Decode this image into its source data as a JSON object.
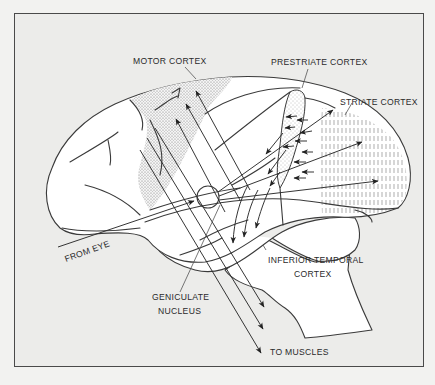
{
  "figure": {
    "type": "anatomical-diagram",
    "background_color": "#ececea",
    "line_color": "#3a3a3a",
    "labels": {
      "motor_cortex": "MOTOR CORTEX",
      "prestriate_cortex": "PRESTRIATE CORTEX",
      "striate_cortex": "STRIATE CORTEX",
      "from_eye": "FROM EYE",
      "geniculate_line1": "GENICULATE",
      "geniculate_line2": "NUCLEUS",
      "inferior_temporal_line1": "INFERIOR TEMPORAL",
      "inferior_temporal_line2": "CORTEX",
      "to_muscles": "TO MUSCLES"
    },
    "regions": [
      {
        "name": "motor-cortex",
        "texture": "stippled"
      },
      {
        "name": "prestriate-cortex",
        "texture": "stippled"
      },
      {
        "name": "striate-cortex",
        "texture": "vertical-dashes"
      }
    ],
    "pathways": [
      "eye -> geniculate nucleus",
      "geniculate nucleus -> striate cortex",
      "striate cortex -> prestriate cortex",
      "prestriate cortex -> inferior temporal cortex",
      "cortex -> motor cortex",
      "motor cortex -> muscles"
    ]
  }
}
